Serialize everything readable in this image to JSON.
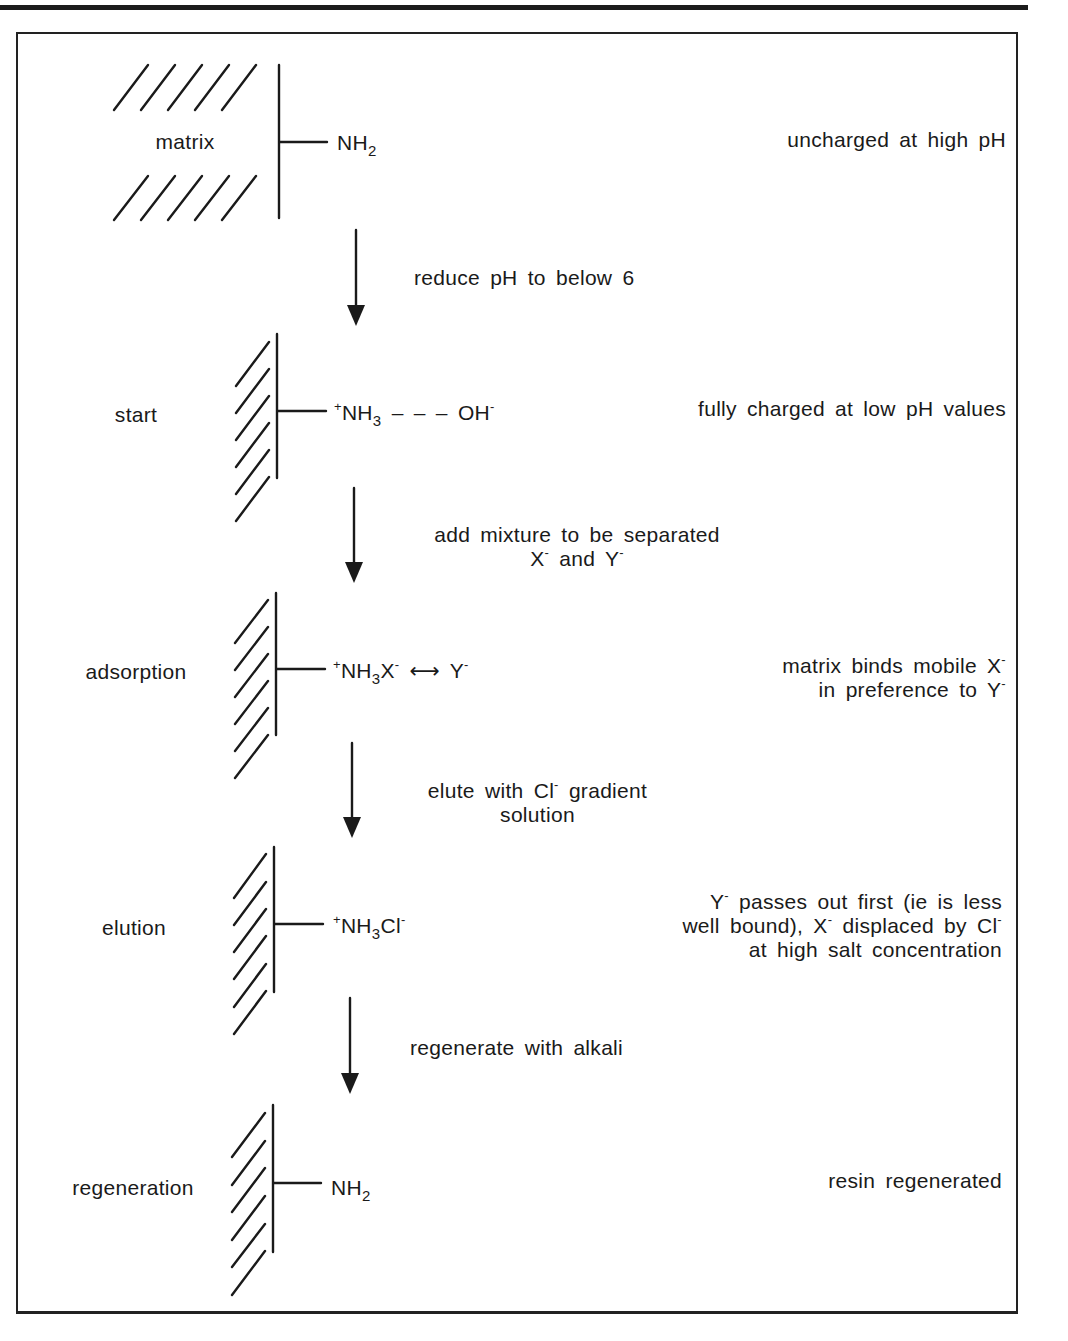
{
  "figure": {
    "colors": {
      "ink": "#1a1a1a",
      "background": "#ffffff",
      "frame": "#222222"
    }
  },
  "stages": [
    {
      "id": "matrix",
      "label": "matrix",
      "group": [
        {
          "t": "NH"
        },
        {
          "sub": "2"
        }
      ],
      "note_lines": [
        [
          {
            "t": "uncharged at high pH"
          }
        ]
      ]
    },
    {
      "id": "start",
      "label": "start",
      "group": [
        {
          "sup": "+"
        },
        {
          "t": "NH"
        },
        {
          "sub": "3"
        },
        {
          "t": " – – – OH"
        },
        {
          "sup": "-"
        }
      ],
      "note_lines": [
        [
          {
            "t": "fully charged at low pH values"
          }
        ]
      ]
    },
    {
      "id": "adsorption",
      "label": "adsorption",
      "group": [
        {
          "sup": "+"
        },
        {
          "t": "NH"
        },
        {
          "sub": "3"
        },
        {
          "t": "X"
        },
        {
          "sup": "-"
        },
        {
          "t": " ⟷ Y"
        },
        {
          "sup": "-"
        }
      ],
      "note_lines": [
        [
          {
            "t": "matrix binds mobile X"
          },
          {
            "sup": "-"
          }
        ],
        [
          {
            "t": "in preference to Y"
          },
          {
            "sup": "-"
          }
        ]
      ]
    },
    {
      "id": "elution",
      "label": "elution",
      "group": [
        {
          "sup": "+"
        },
        {
          "t": "NH"
        },
        {
          "sub": "3"
        },
        {
          "t": "Cl"
        },
        {
          "sup": "-"
        }
      ],
      "note_lines": [
        [
          {
            "t": "Y"
          },
          {
            "sup": "-"
          },
          {
            "t": " passes out first (ie is less"
          }
        ],
        [
          {
            "t": "well bound), X"
          },
          {
            "sup": "-"
          },
          {
            "t": " displaced by Cl"
          },
          {
            "sup": "-"
          }
        ],
        [
          {
            "t": "at high salt concentration"
          }
        ]
      ]
    },
    {
      "id": "regeneration",
      "label": "regeneration",
      "group": [
        {
          "t": "NH"
        },
        {
          "sub": "2"
        }
      ],
      "note_lines": [
        [
          {
            "t": "resin regenerated"
          }
        ]
      ]
    }
  ],
  "steps": [
    {
      "id": "step-reduce-ph",
      "lines": [
        [
          {
            "t": "reduce pH to below 6"
          }
        ]
      ]
    },
    {
      "id": "step-add-mixture",
      "lines": [
        [
          {
            "t": "add mixture to be separated"
          }
        ],
        [
          {
            "t": "X"
          },
          {
            "sup": "-"
          },
          {
            "t": " and Y"
          },
          {
            "sup": "-"
          }
        ]
      ]
    },
    {
      "id": "step-elute",
      "lines": [
        [
          {
            "t": "elute with Cl"
          },
          {
            "sup": "-"
          },
          {
            "t": " gradient"
          }
        ],
        [
          {
            "t": "solution"
          }
        ]
      ]
    },
    {
      "id": "step-regenerate",
      "lines": [
        [
          {
            "t": "regenerate with alkali"
          }
        ]
      ]
    }
  ]
}
